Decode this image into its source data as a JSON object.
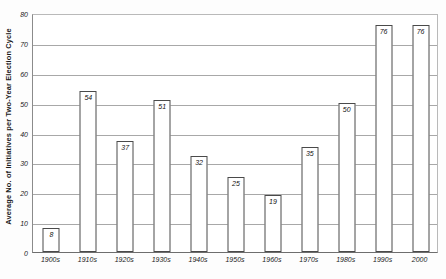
{
  "chart_data": {
    "type": "bar",
    "title": "",
    "subtitle": "",
    "xlabel": "",
    "ylabel": "Average No. of Initiatives per Two-Year Election Cycle",
    "categories": [
      "1900s",
      "1910s",
      "1920s",
      "1930s",
      "1940s",
      "1950s",
      "1960s",
      "1970s",
      "1980s",
      "1990s",
      "2000"
    ],
    "values": [
      8,
      54,
      37,
      51,
      32,
      25,
      19,
      35,
      50,
      76,
      76
    ],
    "value_labels": [
      "8",
      "54",
      "37",
      "51",
      "32",
      "25",
      "19",
      "35",
      "50",
      "76",
      "76"
    ],
    "ylim": [
      0,
      80
    ],
    "ytick_values": [
      0,
      10,
      20,
      30,
      40,
      50,
      60,
      70,
      80
    ],
    "ytick_labels": [
      "0",
      "10",
      "20",
      "30",
      "40",
      "50",
      "60",
      "70",
      "80"
    ],
    "grid": "horizontal",
    "legend": "none",
    "bar_fill_color": "#ffffff",
    "bar_border_color": "#4a4a4a",
    "gridline_color": "#a8a8a8",
    "axis_color": "#6e6e6e",
    "background_color": "#ffffff"
  }
}
